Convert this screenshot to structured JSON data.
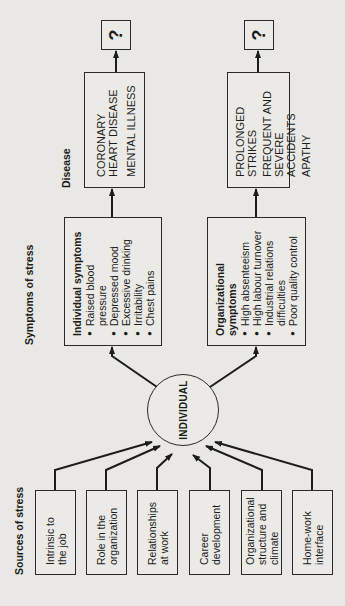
{
  "diagram": {
    "orientation": "rotated 90 degrees counter-clockwise",
    "section_labels": {
      "sources": "Sources of stress",
      "symptoms": "Symptoms of stress",
      "disease": "Disease"
    },
    "sources": [
      {
        "line1": "Intrinsic to",
        "line2": "the job",
        "line3": ""
      },
      {
        "line1": "Role in the",
        "line2": "organization",
        "line3": ""
      },
      {
        "line1": "Relationships",
        "line2": "at work",
        "line3": ""
      },
      {
        "line1": "Career",
        "line2": "development",
        "line3": ""
      },
      {
        "line1": "Organizational",
        "line2": "structure and",
        "line3": "climate"
      },
      {
        "line1": "Home-work",
        "line2": "interface",
        "line3": ""
      }
    ],
    "center": "INDIVIDUAL",
    "symptoms": {
      "individual": {
        "title": "Individual symptoms",
        "items": [
          "Raised blood pressure",
          "Depressed mood",
          "Excessive drinking",
          "Irritability",
          "Chest pains"
        ]
      },
      "organizational": {
        "title_line1": "Organizational",
        "title_line2": "symptoms",
        "items": [
          "High absenteeism",
          "High labour turnover",
          "Industrial relations difficulties",
          "Poor quality control"
        ]
      }
    },
    "outcomes": {
      "individual": [
        "CORONARY HEART DISEASE",
        "MENTAL ILLNESS"
      ],
      "organizational": [
        "PROLONGED STRIKES",
        "FREQUENT AND SEVERE ACCIDENTS",
        "APATHY"
      ]
    },
    "unknown_marker": "?",
    "colors": {
      "background": "#e9e8e4",
      "ink": "#1c1c1c"
    }
  }
}
